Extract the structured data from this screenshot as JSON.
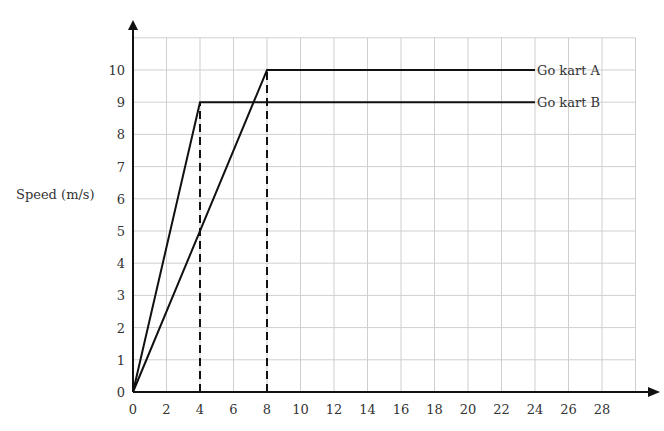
{
  "chart_data": {
    "type": "line",
    "title": "",
    "xlabel": "",
    "ylabel": "Speed (m/s)",
    "xlim": [
      0,
      30
    ],
    "ylim": [
      0,
      11
    ],
    "grid": true,
    "x_ticks": [
      0,
      2,
      4,
      6,
      8,
      10,
      12,
      14,
      16,
      18,
      20,
      22,
      24,
      26,
      28
    ],
    "y_ticks": [
      0,
      1,
      2,
      3,
      4,
      5,
      6,
      7,
      8,
      9,
      10
    ],
    "series": [
      {
        "name": "Go kart A",
        "x": [
          0,
          8,
          24
        ],
        "y": [
          0,
          10,
          10
        ]
      },
      {
        "name": "Go kart B",
        "x": [
          0,
          4,
          24
        ],
        "y": [
          0,
          9,
          9
        ]
      }
    ],
    "annotations": [
      {
        "type": "dashed-vertical",
        "x": 4,
        "from_y": 0,
        "to_y": 9
      },
      {
        "type": "dashed-vertical",
        "x": 8,
        "from_y": 0,
        "to_y": 10
      },
      {
        "type": "line-label",
        "text": "Go kart A",
        "x": 24,
        "y": 10
      },
      {
        "type": "line-label",
        "text": "Go kart B",
        "x": 24,
        "y": 9
      }
    ],
    "legend_position": "inline-right"
  },
  "colors": {
    "line": "#111111",
    "grid": "#cfcfcf",
    "axis": "#111111"
  }
}
